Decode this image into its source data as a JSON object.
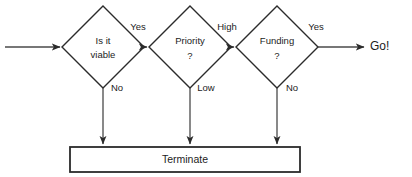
{
  "diagram": {
    "type": "flowchart",
    "colors": {
      "background": "#ffffff",
      "node_stroke": "#2b2b2b",
      "edge_stroke": "#4a4a4a",
      "text": "#1c1c1c"
    },
    "start": {
      "label": ""
    },
    "nodes": [
      {
        "id": "viable",
        "shape": "diamond",
        "line1": "Is it",
        "line2": "viable"
      },
      {
        "id": "priority",
        "shape": "diamond",
        "line1": "Priority",
        "line2": "?"
      },
      {
        "id": "funding",
        "shape": "diamond",
        "line1": "Funding",
        "line2": "?"
      }
    ],
    "terminal": {
      "id": "terminate",
      "shape": "rectangle",
      "label": "Terminate"
    },
    "end": {
      "id": "go",
      "label": "Go!"
    },
    "edge_labels": {
      "viable_yes": "Yes",
      "viable_no": "No",
      "priority_high": "High",
      "priority_low": "Low",
      "funding_yes": "Yes",
      "funding_no": "No"
    }
  }
}
